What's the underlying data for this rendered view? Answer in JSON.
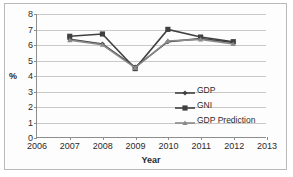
{
  "chart_data": {
    "type": "line",
    "title": "",
    "xlabel": "Year",
    "ylabel": "%",
    "xlim": [
      2006,
      2013
    ],
    "ylim": [
      0,
      8
    ],
    "grid": true,
    "legend_position": "inside lower-right",
    "x": [
      2007,
      2008,
      2009,
      2010,
      2011,
      2012
    ],
    "xticks": [
      "2006",
      "2007",
      "2008",
      "2009",
      "2010",
      "2011",
      "2012",
      "2013"
    ],
    "yticks": [
      "0",
      "1",
      "2",
      "3",
      "4",
      "5",
      "6",
      "7",
      "8"
    ],
    "series": [
      {
        "name": "GDP",
        "marker": "diamond",
        "color": "#3f3f3f",
        "values": [
          6.35,
          6.05,
          4.55,
          6.2,
          6.4,
          6.15
        ]
      },
      {
        "name": "GNI",
        "marker": "square",
        "color": "#404040",
        "values": [
          6.55,
          6.7,
          4.45,
          7.0,
          6.5,
          6.2
        ]
      },
      {
        "name": "GDP Prediction",
        "marker": "triangle",
        "color": "#8a8a8a",
        "values": [
          6.3,
          6.0,
          4.5,
          6.25,
          6.35,
          6.05
        ]
      }
    ]
  },
  "legend": {
    "items": [
      {
        "label": "GDP"
      },
      {
        "label": "GNI"
      },
      {
        "label": "GDP Prediction"
      }
    ]
  },
  "colors": {
    "gdp": "#3f3f3f",
    "gni": "#404040",
    "gdp_prediction": "#8a8a8a",
    "gridline": "#c9c9c9",
    "axis": "#8d8d8d",
    "text": "#2b2b2b",
    "background": "#ffffff"
  }
}
